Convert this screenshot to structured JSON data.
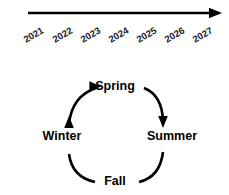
{
  "figure": {
    "background_color": "#ffffff",
    "ink_color": "#000000"
  },
  "timeline": {
    "name": "year-timeline",
    "direction": "left-to-right",
    "arrow_head": "right",
    "label_rotation_degrees": -30,
    "years": [
      {
        "label": "2021",
        "x": 26
      },
      {
        "label": "2022",
        "x": 55
      },
      {
        "label": "2023",
        "x": 83
      },
      {
        "label": "2024",
        "x": 111
      },
      {
        "label": "2025",
        "x": 139
      },
      {
        "label": "2026",
        "x": 167
      },
      {
        "label": "2027",
        "x": 195
      }
    ],
    "axis": {
      "x_start": 28,
      "x_end": 222,
      "y": 13,
      "stroke_width": 2.4
    }
  },
  "cycle": {
    "name": "seasonal-cycle",
    "rotation": "clockwise",
    "center": {
      "x": 115,
      "y": 136
    },
    "radius": 43,
    "nodes": [
      {
        "id": "spring",
        "label": "Spring",
        "position": "top",
        "x": 115,
        "y": 90,
        "anchor": "middle"
      },
      {
        "id": "summer",
        "label": "Summer",
        "position": "right",
        "x": 172,
        "y": 140,
        "anchor": "middle"
      },
      {
        "id": "fall",
        "label": "Fall",
        "position": "bottom",
        "x": 115,
        "y": 185,
        "anchor": "middle"
      },
      {
        "id": "winter",
        "label": "Winter",
        "position": "left",
        "x": 62,
        "y": 140,
        "anchor": "middle"
      }
    ],
    "arcs": [
      {
        "id": "spring-to-summer",
        "from": "spring",
        "to": "summer",
        "arrow_head": "down",
        "path": "M 144 88 Q 162 95 163 121"
      },
      {
        "id": "summer-to-fall",
        "from": "summer",
        "to": "fall",
        "arrow_head": "none",
        "path": "M 163 152 Q 160 177 139 182"
      },
      {
        "id": "fall-to-winter",
        "from": "fall",
        "to": "winter",
        "arrow_head": "up",
        "path": "M 95 182 Q 72 177 69 154"
      },
      {
        "id": "winter-to-spring",
        "from": "winter",
        "to": "spring",
        "arrow_head": "right",
        "path": "M 69 124 Q 72 96 96 88"
      }
    ],
    "arc_stroke_width": 2.6
  }
}
